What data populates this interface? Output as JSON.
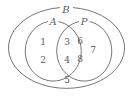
{
  "figure": {
    "type": "venn-diagram",
    "background_color": "#ffffff",
    "stroke_color": "#666666",
    "text_color": "#5a5a5a"
  },
  "sets": {
    "universe": {
      "label": "B",
      "name": "outer-ellipse-B"
    },
    "left": {
      "label": "A",
      "name": "circle-A"
    },
    "right": {
      "label": "P",
      "name": "circle-P"
    }
  },
  "regions": {
    "A_only": {
      "label": "A only",
      "elements": [
        "1",
        "2"
      ]
    },
    "A_and_P": {
      "label": "A intersect P",
      "elements": [
        "3",
        "4"
      ]
    },
    "P_only": {
      "label": "P only",
      "elements": [
        "6",
        "8",
        "7"
      ]
    },
    "B_only": {
      "label": "B only",
      "elements": [
        "5"
      ]
    }
  },
  "elements": [
    {
      "value": "1",
      "region": "A_only",
      "x": 43,
      "y": 42
    },
    {
      "value": "2",
      "region": "A_only",
      "x": 43,
      "y": 60
    },
    {
      "value": "3",
      "region": "A_and_P",
      "x": 67,
      "y": 42
    },
    {
      "value": "4",
      "region": "A_and_P",
      "x": 67,
      "y": 60
    },
    {
      "value": "6",
      "region": "P_only",
      "x": 80,
      "y": 41
    },
    {
      "value": "7",
      "region": "P_only",
      "x": 93,
      "y": 50
    },
    {
      "value": "8",
      "region": "P_only",
      "x": 80,
      "y": 59
    },
    {
      "value": "5",
      "region": "B_only",
      "x": 67,
      "y": 80
    }
  ],
  "labels": {
    "B": {
      "text": "B",
      "x": 66,
      "y": 10
    },
    "A": {
      "text": "A",
      "x": 53,
      "y": 22
    },
    "P": {
      "text": "P",
      "x": 84,
      "y": 22
    }
  }
}
